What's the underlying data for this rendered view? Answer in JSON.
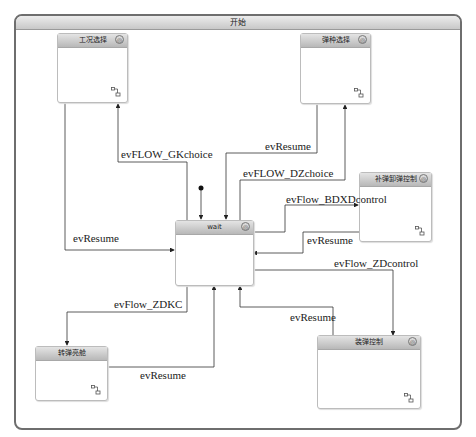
{
  "frame": {
    "title": "开始"
  },
  "states": {
    "gk": {
      "title": "工况选择"
    },
    "dz": {
      "title": "弹种选择"
    },
    "wait": {
      "title": "wait"
    },
    "bdxd": {
      "title": "补弹卸弹控制"
    },
    "zdkc": {
      "title": "转弹亮舱"
    },
    "zd": {
      "title": "装弹控制"
    }
  },
  "transitions": {
    "gk_choice": "evFLOW_GKchoice",
    "gk_resume": "evResume",
    "dz_resume": "evResume",
    "dz_choice": "evFLOW_DZchoice",
    "bdxd_control": "evFlow_BDXDcontrol",
    "bdxd_resume": "evResume",
    "zd_control": "evFlow_ZDcontrol",
    "zd_resume": "evResume",
    "zdkc": "evFlow_ZDKC",
    "zdkc_resume": "evResume"
  },
  "icons": {
    "state_gear": "gear-icon",
    "submachine": "submachine-icon"
  }
}
